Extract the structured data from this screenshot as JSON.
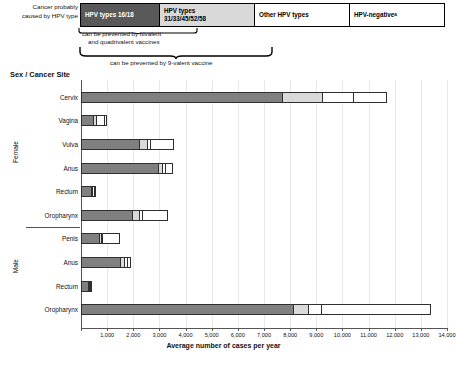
{
  "legend": {
    "caption_line1": "Cancer probably",
    "caption_line2": "caused by HPV type",
    "items": [
      {
        "label": "HPV types 16/18",
        "color": "#808080"
      },
      {
        "label": "HPV types\n31/33/45/52/58",
        "label_line1": "HPV types",
        "label_line2": "31/33/45/52/58",
        "color": "#d9d9d9"
      },
      {
        "label": "Other HPV types",
        "color": "#ffffff"
      },
      {
        "label": "HPV-negative",
        "superscript": "a",
        "color": "#ffffff"
      }
    ]
  },
  "notes": {
    "bivalent_line1": "can be prevented by bivalent",
    "bivalent_line2": "and quadrivalent vaccines",
    "nine_valent": "can be prevented by 9-valent vaccine"
  },
  "axis_title": "Sex / Cancer Site",
  "footnote": "",
  "chart_data": {
    "type": "bar",
    "orientation": "horizontal",
    "stacked": true,
    "title": "",
    "xlabel": "Average number of cases per year",
    "ylabel": "Sex / Cancer Site",
    "xlim": [
      0,
      14000
    ],
    "xticks": [
      0,
      1000,
      2000,
      3000,
      4000,
      5000,
      6000,
      7000,
      8000,
      9000,
      10000,
      11000,
      12000,
      13000,
      14000
    ],
    "xtick_labels": [
      "",
      "1,000",
      "2,000",
      "3,000",
      "4,000",
      "5,000",
      "6,000",
      "7,000",
      "8,000",
      "9,000",
      "10,000",
      "11,000",
      "12,000",
      "13,000",
      "14,000"
    ],
    "grid": true,
    "legend_position": "top",
    "series": [
      {
        "name": "HPV types 16/18",
        "color": "#808080"
      },
      {
        "name": "HPV types 31/33/45/52/58",
        "color": "#d9d9d9"
      },
      {
        "name": "Other HPV types",
        "color": "#ffffff"
      },
      {
        "name": "HPV-negative",
        "color": "#ffffff"
      }
    ],
    "groups": [
      {
        "name": "Female",
        "categories": [
          "Cervix",
          "Vagina",
          "Vulva",
          "Anus",
          "Rectum",
          "Oropharynx"
        ],
        "values": [
          [
            7700,
            1500,
            1200,
            1300
          ],
          [
            450,
            120,
            300,
            130
          ],
          [
            2200,
            330,
            120,
            900
          ],
          [
            2950,
            130,
            140,
            300
          ],
          [
            380,
            40,
            60,
            60
          ],
          [
            1950,
            260,
            110,
            1000
          ]
        ]
      },
      {
        "name": "Male",
        "categories": [
          "Penis",
          "Anus",
          "Rectum",
          "Oropharynx"
        ],
        "values": [
          [
            700,
            50,
            60,
            670
          ],
          [
            1500,
            130,
            140,
            150
          ],
          [
            270,
            30,
            40,
            40
          ],
          [
            8100,
            600,
            500,
            4200
          ]
        ]
      }
    ]
  }
}
